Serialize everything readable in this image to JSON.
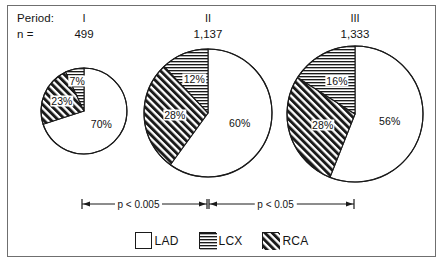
{
  "header": {
    "period_label": "Period:",
    "n_label": "n =",
    "columns": [
      {
        "period": "I",
        "n": "499"
      },
      {
        "period": "II",
        "n": "1,137"
      },
      {
        "period": "III",
        "n": "1,333"
      }
    ]
  },
  "pies": [
    {
      "name": "period-i",
      "n": "499",
      "slices": [
        {
          "key": "LAD",
          "value": 70,
          "label": "70%",
          "fill": "white"
        },
        {
          "key": "RCA",
          "value": 23,
          "label": "23%",
          "fill": "diagonal"
        },
        {
          "key": "LCX",
          "value": 7,
          "label": "7%",
          "fill": "horizontal"
        }
      ]
    },
    {
      "name": "period-ii",
      "n": "1,137",
      "slices": [
        {
          "key": "LAD",
          "value": 60,
          "label": "60%",
          "fill": "white"
        },
        {
          "key": "RCA",
          "value": 28,
          "label": "28%",
          "fill": "diagonal"
        },
        {
          "key": "LCX",
          "value": 12,
          "label": "12%",
          "fill": "horizontal"
        }
      ]
    },
    {
      "name": "period-iii",
      "n": "1,333",
      "slices": [
        {
          "key": "LAD",
          "value": 56,
          "label": "56%",
          "fill": "white"
        },
        {
          "key": "RCA",
          "value": 28,
          "label": "28%",
          "fill": "diagonal"
        },
        {
          "key": "LCX",
          "value": 16,
          "label": "16%",
          "fill": "horizontal"
        }
      ]
    }
  ],
  "significance": [
    {
      "text": "p < 0.005",
      "from": "I",
      "to": "II"
    },
    {
      "text": "p < 0.05",
      "from": "II",
      "to": "III"
    }
  ],
  "legend": [
    {
      "label": "LAD",
      "fill": "white"
    },
    {
      "label": "LCX",
      "fill": "horizontal"
    },
    {
      "label": "RCA",
      "fill": "diagonal"
    }
  ],
  "colors": {
    "stroke": "#1a1a1a",
    "text": "#141414",
    "frame": "#6f6f6f",
    "background": "#ffffff"
  },
  "chart_data": {
    "type": "pie",
    "title": "",
    "xlabel": "",
    "ylabel": "",
    "categories": [
      "LAD",
      "LCX",
      "RCA"
    ],
    "legend_position": "bottom",
    "grid": false,
    "units": "percent",
    "charts": [
      {
        "name": "Period I",
        "n": 499,
        "values": [
          70,
          7,
          23
        ],
        "labels": [
          "70%",
          "7%",
          "23%"
        ]
      },
      {
        "name": "Period II",
        "n": 1137,
        "values": [
          60,
          12,
          28
        ],
        "labels": [
          "60%",
          "12%",
          "28%"
        ]
      },
      {
        "name": "Period III",
        "n": 1333,
        "values": [
          56,
          16,
          28
        ],
        "labels": [
          "56%",
          "16%",
          "28%"
        ]
      }
    ],
    "annotations": [
      "p < 0.005",
      "p < 0.05"
    ]
  }
}
